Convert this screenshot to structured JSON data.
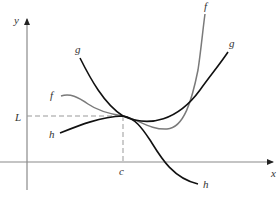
{
  "figure": {
    "axes": {
      "x_label": "x",
      "y_label": "y"
    },
    "point": {
      "x_label": "c",
      "y_label": "L"
    },
    "curves": [
      {
        "name": "f",
        "start_label": "f",
        "end_label": "f",
        "color": "#7a7a7a"
      },
      {
        "name": "g",
        "start_label": "g",
        "end_label": "g",
        "color": "#111111"
      },
      {
        "name": "h",
        "start_label": "h",
        "end_label": "h",
        "color": "#111111"
      }
    ],
    "colors": {
      "axis": "#8a8a8a",
      "dashed_guide": "#999999",
      "label": "#333333",
      "background": "#ffffff"
    }
  }
}
